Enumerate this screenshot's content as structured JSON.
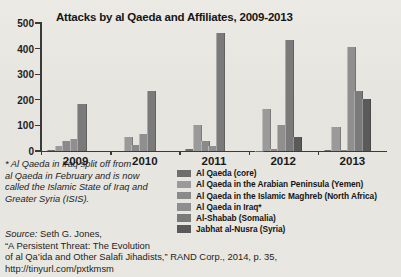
{
  "chart_data": {
    "type": "bar",
    "title": "Attacks by al Qaeda and Affiliates, 2009-2013",
    "xlabel": "",
    "ylabel": "",
    "ylim": [
      0,
      500
    ],
    "yticks": [
      0,
      100,
      200,
      300,
      400,
      500
    ],
    "grid": false,
    "legend_position": "bottom-right",
    "categories": [
      "2009",
      "2010",
      "2011",
      "2012",
      "2013"
    ],
    "series": [
      {
        "name": "Al Qaeda (core)",
        "color": "#6e6e6e",
        "values": [
          5,
          0,
          8,
          2,
          3
        ]
      },
      {
        "name": "Al Qaeda in the Arabian Peninsula (Yemen)",
        "color": "#9a9a9a",
        "values": [
          18,
          55,
          100,
          165,
          92
        ]
      },
      {
        "name": "Al Qaeda in the Islamic Maghreb (North Africa)",
        "color": "#8a8a8a",
        "values": [
          38,
          25,
          38,
          8,
          5
        ]
      },
      {
        "name": "Al Qaeda in Iraq*",
        "color": "#8f8f8f",
        "values": [
          48,
          68,
          20,
          100,
          408
        ]
      },
      {
        "name": "Al-Shabab (Somalia)",
        "color": "#7a7a7a",
        "values": [
          182,
          235,
          460,
          435,
          235
        ]
      },
      {
        "name": "Jabhat al-Nusra (Syria)",
        "color": "#5a5a5a",
        "values": [
          0,
          0,
          0,
          55,
          202
        ]
      }
    ]
  },
  "footnote": {
    "lines": [
      "* Al Qaeda in Iraq split off from",
      "al Qaeda in February and is now",
      "called the Islamic State of Iraq and",
      "Greater Syria (ISIS)."
    ]
  },
  "source": {
    "label": "Source:",
    "lines": [
      " Seth G. Jones,",
      "“A Persistent Threat: The Evolution",
      "of al Qa’ida and Other Salafi Jihadists,” RAND Corp., 2014, p. 35,",
      "http://tinyurl.com/pxtkmsm"
    ]
  },
  "colors": {
    "background": "#e8e6e1",
    "axis": "#3a3a3a",
    "text": "#1a1a1a"
  }
}
